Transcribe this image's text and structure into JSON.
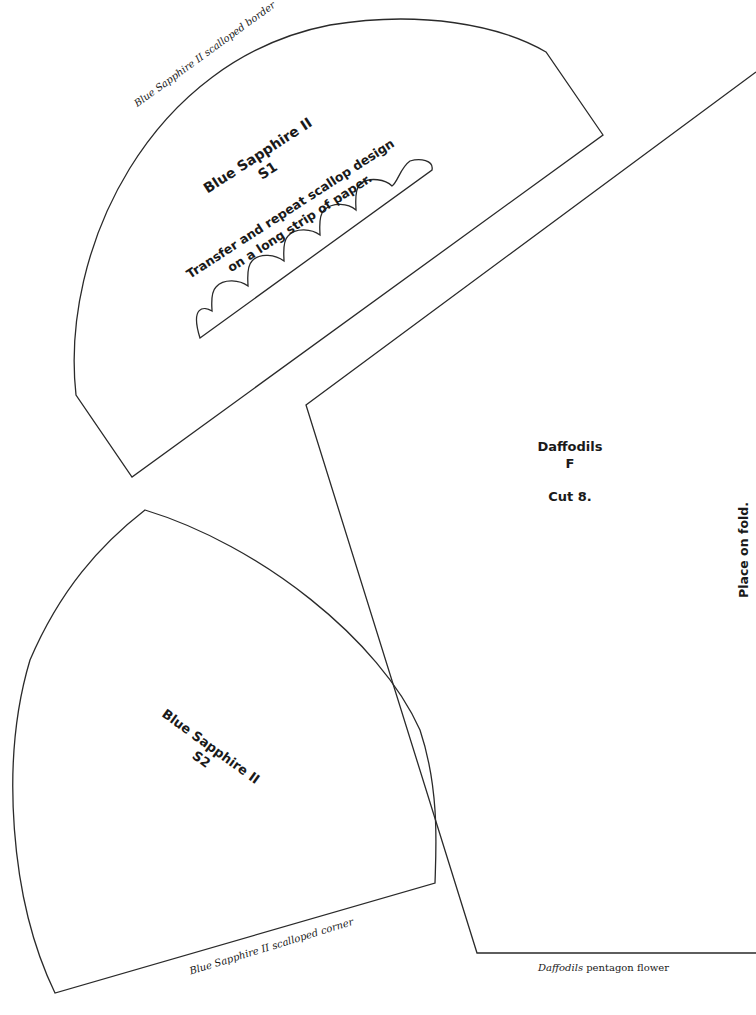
{
  "pattern_sheet": {
    "s1": {
      "caption": "Blue Sapphire II scalloped border",
      "title_line1": "Blue Sapphire II",
      "title_line2": "S1",
      "instruction_line1": "Transfer and repeat scallop design",
      "instruction_line2": "on a long strip of paper."
    },
    "s2": {
      "caption": "Blue Sapphire II scalloped corner",
      "title_line1": "Blue Sapphire II",
      "title_line2": "S2"
    },
    "daffodils": {
      "title_line1": "Daffodils",
      "title_line2": "F",
      "cut_note": "Cut 8.",
      "fold_note": "Place on fold.",
      "caption_italic": "Daffodils",
      "caption_rest": "pentagon flower"
    }
  }
}
